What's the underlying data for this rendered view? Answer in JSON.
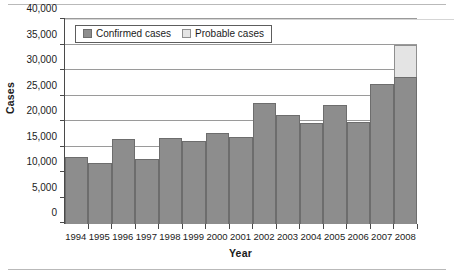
{
  "chart_data": {
    "type": "bar",
    "subtype": "stacked-bar",
    "title": "",
    "xlabel": "Year",
    "ylabel": "Cases",
    "categories": [
      "1994",
      "1995",
      "1996",
      "1997",
      "1998",
      "1999",
      "2000",
      "2001",
      "2002",
      "2003",
      "2004",
      "2005",
      "2006",
      "2007",
      "2008"
    ],
    "series": [
      {
        "name": "Confirmed cases",
        "color": "#8d8d8d",
        "values": [
          13100,
          11900,
          16600,
          12750,
          16800,
          16300,
          17850,
          17100,
          23800,
          21350,
          19900,
          23400,
          20050,
          27500,
          28900
        ]
      },
      {
        "name": "Probable cases",
        "color": "#e4e4e4",
        "values": [
          0,
          0,
          0,
          0,
          0,
          0,
          0,
          0,
          0,
          0,
          0,
          0,
          0,
          0,
          6400
        ]
      }
    ],
    "ylim": [
      0,
      40000
    ],
    "ytick_values": [
      0,
      5000,
      10000,
      15000,
      20000,
      25000,
      30000,
      35000,
      40000
    ],
    "ytick_labels": [
      "0",
      "5,000",
      "10,000",
      "15,000",
      "20,000",
      "25,000",
      "30,000",
      "35,000",
      "40,000"
    ],
    "grid": "horizontal",
    "legend_position": "top-left-inside"
  },
  "legend": {
    "entries": [
      {
        "label": "Confirmed cases",
        "swatch": "dark-gray-swatch"
      },
      {
        "label": "Probable cases",
        "swatch": "light-gray-swatch"
      }
    ]
  },
  "axes": {
    "y_title": "Cases",
    "x_title": "Year"
  }
}
